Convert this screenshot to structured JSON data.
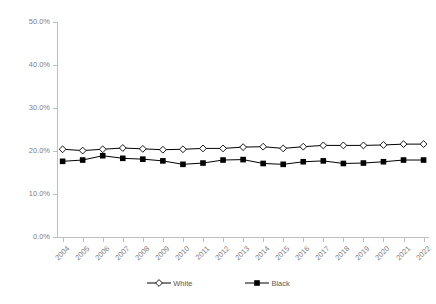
{
  "chart_data": {
    "type": "line",
    "title": "",
    "subtitle": "",
    "xlabel": "",
    "ylabel": "",
    "grid": false,
    "legend_position": "bottom",
    "x": [
      "2004",
      "2005",
      "2006",
      "2007",
      "2008",
      "2009",
      "2010",
      "2011",
      "2012",
      "2013",
      "2014",
      "2015",
      "2016",
      "2017",
      "2018",
      "2019",
      "2020",
      "2021",
      "2022"
    ],
    "categories": [
      "2004",
      "2005",
      "2006",
      "2007",
      "2008",
      "2009",
      "2010",
      "2011",
      "2012",
      "2013",
      "2014",
      "2015",
      "2016",
      "2017",
      "2018",
      "2019",
      "2020",
      "2021",
      "2022"
    ],
    "ylim": [
      0,
      50
    ],
    "y_ticks": [
      0,
      10,
      20,
      30,
      40,
      50
    ],
    "y_tick_labels": [
      "0.0%",
      "10.0%",
      "20.0%",
      "30.0%",
      "40.0%",
      "50.0%"
    ],
    "series": [
      {
        "name": "White",
        "marker": "open-diamond",
        "color": "#000000",
        "values": [
          20.4,
          20.1,
          20.4,
          20.7,
          20.5,
          20.3,
          20.4,
          20.6,
          20.6,
          20.9,
          21.0,
          20.6,
          21.0,
          21.3,
          21.3,
          21.3,
          21.4,
          21.6,
          21.6
        ]
      },
      {
        "name": "Black",
        "marker": "filled-square",
        "color": "#000000",
        "values": [
          17.6,
          17.9,
          18.9,
          18.3,
          18.1,
          17.7,
          16.9,
          17.2,
          17.9,
          18.0,
          17.1,
          16.9,
          17.5,
          17.7,
          17.1,
          17.2,
          17.5,
          17.9,
          17.9
        ]
      }
    ]
  },
  "legend": {
    "items": [
      {
        "label": "White"
      },
      {
        "label": "Black"
      }
    ]
  },
  "colors": {
    "axis": "#bfbfbf",
    "tick_text": "#7f7f7f",
    "legend_text": "#595959",
    "series_line": "#000000",
    "background": "#ffffff"
  }
}
